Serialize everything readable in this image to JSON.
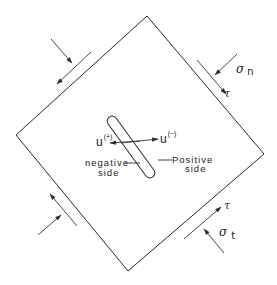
{
  "diagram": {
    "colors": {
      "stroke": "#2a2a2a",
      "background": "#ffffff"
    },
    "stress_labels": {
      "sigma_n": {
        "symbol": "σ",
        "subscript": "n"
      },
      "sigma_t": {
        "symbol": "σ",
        "subscript": "t"
      },
      "tau_top": "τ",
      "tau_bottom": "τ"
    },
    "crack": {
      "u_plus": {
        "base": "u",
        "superscript": "(+)"
      },
      "u_minus": {
        "base": "u",
        "superscript": "(−)"
      },
      "negative_side": {
        "line1": "negative",
        "line2": "side"
      },
      "positive_side": {
        "line1": "Positive",
        "line2": "side"
      }
    }
  }
}
